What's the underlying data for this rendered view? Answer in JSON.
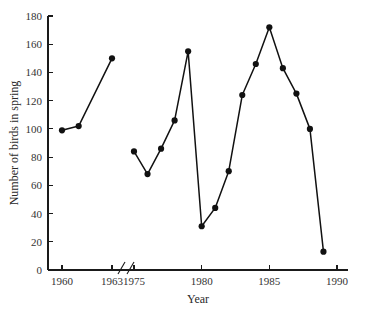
{
  "chart_data": {
    "type": "line",
    "title": "",
    "xlabel": "Year",
    "ylabel": "Number of birds in spring",
    "grid": false,
    "legend": "none",
    "marker": "filled-circle",
    "axis_break": {
      "present": true,
      "style": "double-slash",
      "between": [
        1963,
        1975
      ]
    },
    "ylim": [
      0,
      180
    ],
    "yticks": [
      0,
      20,
      40,
      60,
      80,
      100,
      120,
      140,
      160,
      180
    ],
    "ytick_labels": [
      "0",
      "20",
      "40",
      "60",
      "80",
      "100",
      "120",
      "140",
      "160",
      "180"
    ],
    "xticks": [
      1960,
      1963,
      1975,
      1980,
      1985,
      1990
    ],
    "xtick_labels": [
      "1960",
      "1963",
      "1975",
      "1980",
      "1985",
      "1990"
    ],
    "series": [
      {
        "name": "segment-1",
        "x": [
          1960,
          1961,
          1963
        ],
        "values": [
          99,
          102,
          150
        ]
      },
      {
        "name": "segment-2",
        "x": [
          1975,
          1976,
          1977,
          1978,
          1979,
          1980,
          1981,
          1982,
          1983,
          1984,
          1985,
          1986,
          1987,
          1988,
          1989
        ],
        "values": [
          84,
          68,
          86,
          106,
          155,
          31,
          44,
          70,
          124,
          146,
          172,
          143,
          125,
          100,
          13
        ]
      }
    ],
    "colors": {
      "line": "#111111",
      "marker": "#111111",
      "axis": "#1a1a1a",
      "text": "#333333",
      "background": "#ffffff"
    }
  }
}
